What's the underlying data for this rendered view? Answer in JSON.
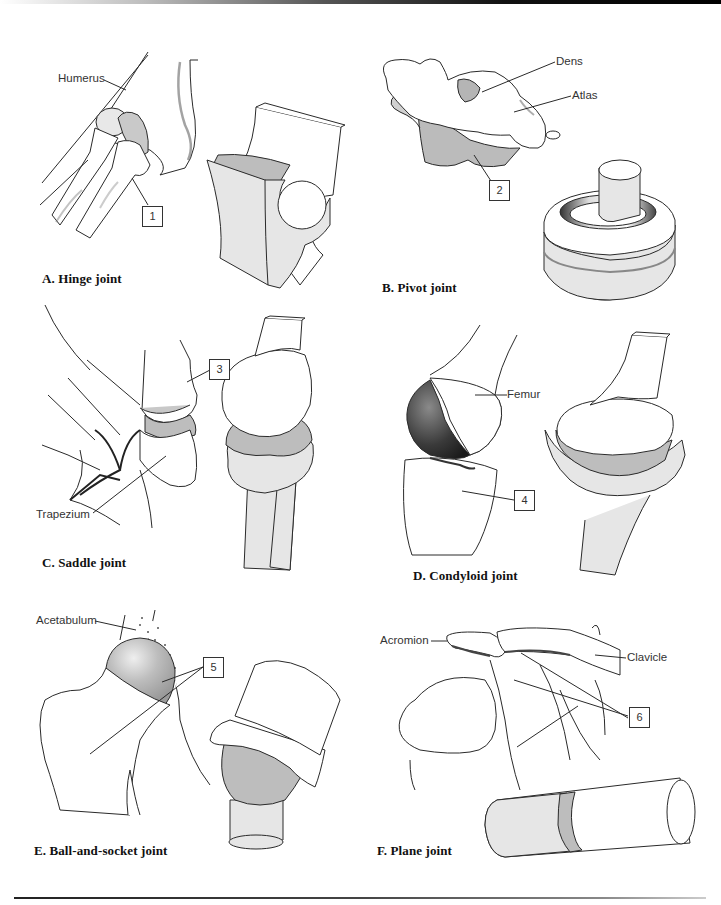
{
  "figure": {
    "colors": {
      "bone_fill": "#ffffff",
      "model_light": "#e6e6e6",
      "model_mid": "#b8b8b8",
      "cartilage": "#bdbdbd",
      "outline": "#2a2a2a"
    },
    "panels": [
      {
        "id": "A",
        "title": "A. Hinge joint",
        "labels": [
          {
            "text": "Humerus"
          }
        ],
        "number": "1"
      },
      {
        "id": "B",
        "title": "B. Pivot joint",
        "labels": [
          {
            "text": "Dens"
          },
          {
            "text": "Atlas"
          }
        ],
        "number": "2"
      },
      {
        "id": "C",
        "title": "C. Saddle joint",
        "labels": [
          {
            "text": "Trapezium"
          }
        ],
        "number": "3"
      },
      {
        "id": "D",
        "title": "D. Condyloid joint",
        "labels": [
          {
            "text": "Femur"
          }
        ],
        "number": "4"
      },
      {
        "id": "E",
        "title": "E. Ball-and-socket joint",
        "labels": [
          {
            "text": "Acetabulum"
          }
        ],
        "number": "5"
      },
      {
        "id": "F",
        "title": "F. Plane joint",
        "labels": [
          {
            "text": "Acromion"
          },
          {
            "text": "Clavicle"
          }
        ],
        "number": "6"
      }
    ]
  }
}
